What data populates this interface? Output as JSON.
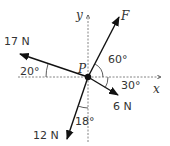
{
  "diagram": {
    "point_label": "P",
    "axes": {
      "x_label": "x",
      "y_label": "y"
    },
    "forces": [
      {
        "name": "F",
        "label": "F",
        "angle_label": "60°"
      },
      {
        "name": "17N",
        "label": "17 N",
        "angle_label": "20°"
      },
      {
        "name": "6N",
        "label": "6 N",
        "angle_label": "30°"
      },
      {
        "name": "12N",
        "label": "12 N",
        "angle_label": "18°"
      }
    ],
    "colors": {
      "ink": "#222222",
      "axis": "#777777"
    }
  }
}
